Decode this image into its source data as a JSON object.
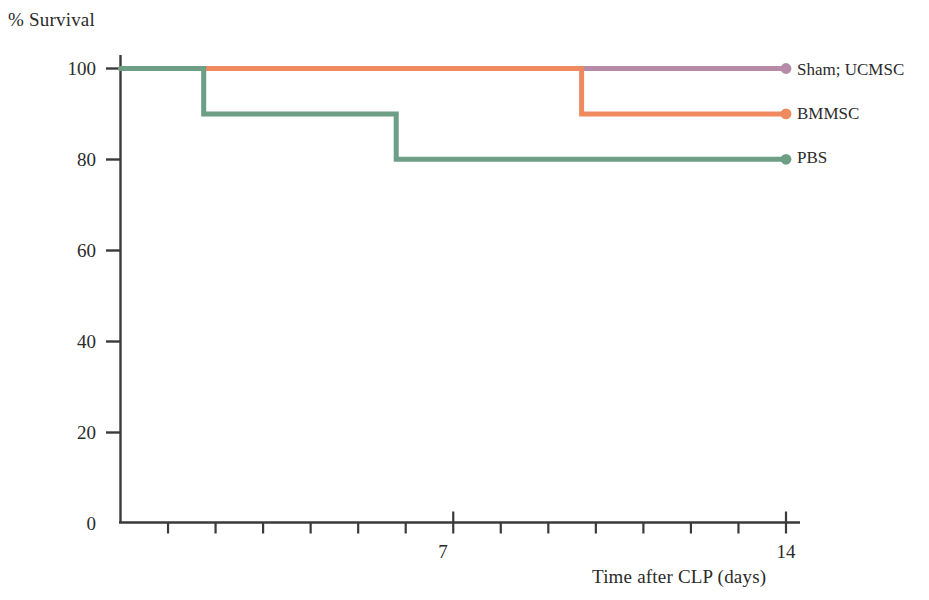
{
  "chart_data": {
    "type": "line",
    "title": "",
    "subtitle": "",
    "xlabel": "Time after CLP (days)",
    "ylabel": "% Survival",
    "xlim": [
      0,
      14
    ],
    "ylim": [
      0,
      100
    ],
    "grid": false,
    "legend_position": "right",
    "step_plot": true,
    "xticks": [
      0,
      1,
      2,
      3,
      4,
      5,
      6,
      7,
      8,
      9,
      10,
      11,
      12,
      13,
      14
    ],
    "xtick_labels": [
      "",
      "",
      "",
      "",
      "",
      "",
      "",
      "7",
      "",
      "",
      "",
      "",
      "",
      "",
      "14"
    ],
    "yticks": [
      0,
      20,
      40,
      60,
      80,
      100
    ],
    "ytick_labels": [
      "0",
      "20",
      "40",
      "60",
      "80",
      "100"
    ],
    "series": [
      {
        "name": "Sham; UCMSC",
        "color": "#b58ba8",
        "end_marker": true,
        "x": [
          0,
          14
        ],
        "y": [
          100,
          100
        ]
      },
      {
        "name": "BMMSC",
        "color": "#ef8a5e",
        "end_marker": true,
        "x": [
          0,
          9.7,
          9.7,
          14
        ],
        "y": [
          100,
          100,
          90,
          90
        ]
      },
      {
        "name": "PBS",
        "color": "#6d9e86",
        "end_marker": true,
        "x": [
          0,
          1.75,
          1.75,
          5.8,
          5.8,
          14
        ],
        "y": [
          100,
          100,
          90,
          90,
          80,
          80
        ]
      }
    ]
  },
  "legend": {
    "items": [
      {
        "label": "Sham; UCMSC",
        "color": "#b58ba8"
      },
      {
        "label": "BMMSC",
        "color": "#ef8a5e"
      },
      {
        "label": "PBS",
        "color": "#6d9e86"
      }
    ]
  },
  "axis": {
    "y_title": "% Survival",
    "x_title": "Time after CLP (days)",
    "y_tick_labels": [
      "100",
      "80",
      "60",
      "40",
      "20",
      "0"
    ],
    "x_tick_labels": [
      "7",
      "14"
    ]
  },
  "colors": {
    "axis": "#3a3a3a",
    "text": "#2b2b2b",
    "background": "#ffffff",
    "series_sham_ucmsc": "#b58ba8",
    "series_bmmsc": "#ef8a5e",
    "series_pbs": "#6d9e86"
  }
}
